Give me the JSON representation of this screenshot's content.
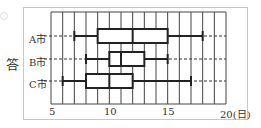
{
  "chart_data": {
    "type": "boxplot",
    "title": "",
    "ylabel": "答",
    "xlabel": "(日)",
    "xlim": [
      5,
      20
    ],
    "xticks": [
      5,
      10,
      15,
      20
    ],
    "xtick_labels": [
      "5",
      "10",
      "15",
      "20(日)"
    ],
    "grid": true,
    "series": [
      {
        "name": "A市",
        "min": 7,
        "q1": 9,
        "median": 12,
        "q3": 15,
        "max": 18
      },
      {
        "name": "B市",
        "min": 8,
        "q1": 10,
        "median": 11,
        "q3": 13,
        "max": 15
      },
      {
        "name": "C市",
        "min": 6,
        "q1": 8,
        "median": 10,
        "q3": 12,
        "max": 17
      }
    ]
  },
  "labels": {
    "answer": "答",
    "rowA": "A市",
    "rowB": "B市",
    "rowC": "C市",
    "tick5": "5",
    "tick10": "10",
    "tick15": "15",
    "tick20": "20(日)"
  }
}
